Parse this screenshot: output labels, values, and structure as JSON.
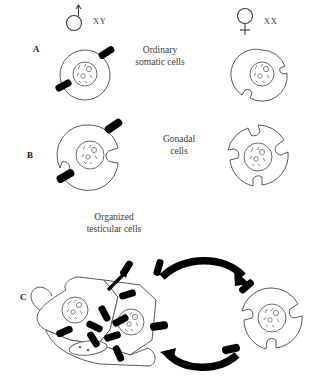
{
  "figure": {
    "title_visible": false,
    "background_color": "#ffffff",
    "ink_color": "#4a4a4a",
    "bar_color": "#000000",
    "width": 318,
    "height": 391
  },
  "sex_symbols": [
    {
      "name": "male-symbol",
      "glyph": "mars",
      "karyotype": "XY",
      "x": 72,
      "y": 8
    },
    {
      "name": "female-symbol",
      "glyph": "venus",
      "karyotype": "XX",
      "x": 243,
      "y": 8
    }
  ],
  "panels": [
    {
      "id": "A",
      "label": "A",
      "label_x": 33,
      "label_y": 44,
      "group_label": "Ordinary\nsomatic cells",
      "group_label_line1": "Ordinary",
      "group_label_line2": "somatic cells",
      "group_label_x": 159,
      "group_label_y": 50,
      "cells": [
        {
          "name": "male-somatic-cell",
          "sex": "male",
          "bars": 2,
          "notches": 0,
          "cx": 85,
          "cy": 75,
          "r": 25
        },
        {
          "name": "female-somatic-cell",
          "sex": "female",
          "bars": 0,
          "notches": 2,
          "cx": 262,
          "cy": 75,
          "r": 25
        }
      ]
    },
    {
      "id": "B",
      "label": "B",
      "label_x": 27,
      "label_y": 153,
      "group_label_line1": "Gonadal",
      "group_label_line2": "cells",
      "group_label_x": 180,
      "group_label_y": 139,
      "cells": [
        {
          "name": "male-gonadal-cell",
          "sex": "male",
          "bars": 2,
          "notches": 2,
          "cx": 90,
          "cy": 155,
          "r": 30
        },
        {
          "name": "female-gonadal-cell",
          "sex": "female",
          "bars": 0,
          "notches": 4,
          "cx": 258,
          "cy": 155,
          "r": 30
        }
      ]
    },
    {
      "id": "C",
      "label": "C",
      "label_x": 20,
      "label_y": 296,
      "group_label_line1": "Organized",
      "group_label_line2": "testicular cells",
      "group_label_x": 113,
      "group_label_y": 216,
      "cells": [
        {
          "name": "organized-testicular-cell-cluster",
          "sex": "male",
          "nuclei": 3,
          "bars": 9
        },
        {
          "name": "dissociated-testicular-cell",
          "sex": "male",
          "bars": 3,
          "notches": 3,
          "cx": 272,
          "cy": 318,
          "r": 30
        }
      ],
      "arrows": [
        {
          "name": "arrow-dissociation",
          "direction": "left-to-right",
          "style": "thick-curved"
        },
        {
          "name": "arrow-reaggregation",
          "direction": "right-to-left",
          "style": "thick-curved"
        },
        {
          "name": "arrow-bar-release",
          "direction": "up-right",
          "style": "thin-straight"
        }
      ]
    }
  ]
}
